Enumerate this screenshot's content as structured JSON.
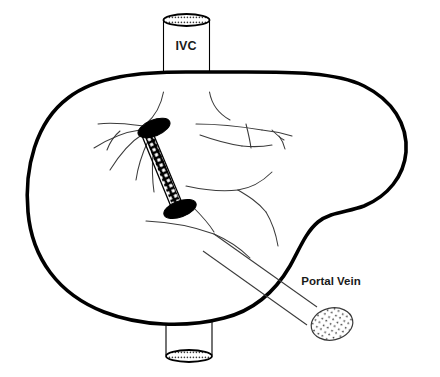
{
  "diagram": {
    "background_color": "#ffffff",
    "line_color": "#000000",
    "vessel_line_color": "#3b3b3b",
    "width": 440,
    "height": 377
  },
  "labels": {
    "ivc": "IVC",
    "portal_vein": "Portal Vein"
  },
  "structures": {
    "liver": {
      "name": "liver-outline",
      "stroke_width": 3.6,
      "fill": "#ffffff"
    },
    "ivc_vessel": {
      "name": "inferior-vena-cava",
      "label": "IVC",
      "stroke_width": 1.1,
      "top_cap_style": "stippled-ellipse",
      "bottom_cap_style": "stippled-ellipse"
    },
    "portal_vein_vessel": {
      "name": "portal-vein",
      "label": "Portal Vein",
      "stroke_width": 1.0,
      "end_cap_style": "stippled-ellipse"
    },
    "stent": {
      "name": "tips-stent-shunt",
      "pattern": "cross-hatch-mesh",
      "cap_fill": "#000000",
      "stroke_width": 1.2
    }
  }
}
